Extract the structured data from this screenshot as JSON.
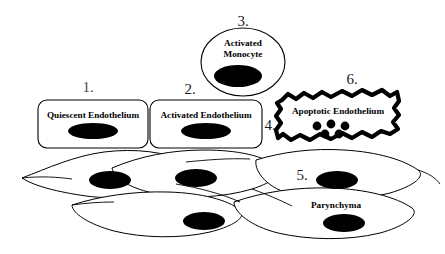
{
  "figure": {
    "background_color": "#ffffff",
    "line_color": "#000000",
    "nucleus_color": "#000000"
  },
  "numbers": {
    "one": "1.",
    "two": "2.",
    "three": "3.",
    "four": "4.",
    "five": "5.",
    "six": "6."
  },
  "cells": {
    "quiescent_endothelium": {
      "label": "Quiescent Endothelium",
      "number": "1.",
      "shape": "rounded-rectangle"
    },
    "activated_endothelium": {
      "label": "Activated Endothelium",
      "number": "2.",
      "shape": "rounded-rectangle"
    },
    "activated_monocyte": {
      "label_line1": "Activated",
      "label_line2": "Monocyte",
      "number": "3.",
      "shape": "ellipse"
    },
    "apoptotic_endothelium": {
      "label": "Apoptotic Endothelium",
      "number": "6.",
      "pointer_number": "4.",
      "shape": "jagged-blob",
      "apoptotic_body_count": 5
    },
    "parenchyma": {
      "label": "Parynchyma",
      "number": "5.",
      "shape": "spindle-sheet",
      "visible_nuclei": 5
    }
  }
}
